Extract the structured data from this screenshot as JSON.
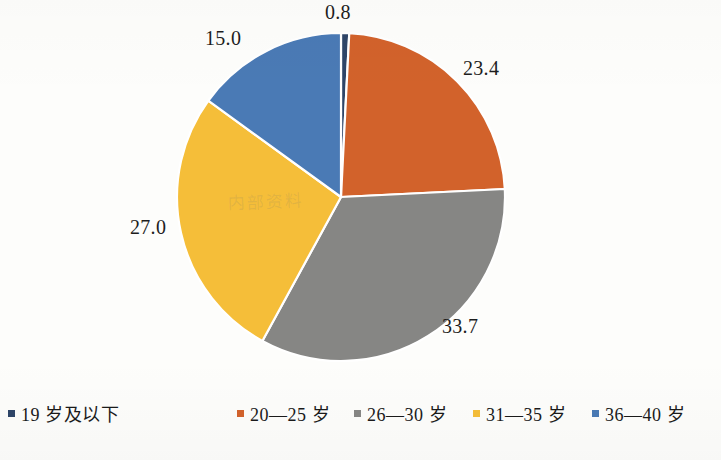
{
  "chart_data": {
    "type": "pie",
    "title": "",
    "subtitle": "",
    "xlabel": "",
    "ylabel": "",
    "legend_position": "bottom",
    "grid": false,
    "categories": [
      "19 岁及以下",
      "20—25 岁",
      "26—30 岁",
      "31—35 岁",
      "36—40 岁"
    ],
    "values": [
      0.8,
      23.4,
      33.7,
      27.0,
      15.0
    ],
    "value_labels": [
      "0.8",
      "23.4",
      "33.7",
      "27.0",
      "15.0"
    ],
    "colors": [
      "#2e4568",
      "#d2622b",
      "#868684",
      "#f5be39",
      "#4a7ab5"
    ],
    "start_angle_deg": 0,
    "direction": "clockwise",
    "slice_border_color": "#ffffff",
    "slices": [
      {
        "label": "19 岁及以下",
        "value": 0.8,
        "display": "0.8",
        "color": "#2e4568"
      },
      {
        "label": "20—25 岁",
        "value": 23.4,
        "display": "23.4",
        "color": "#d2622b"
      },
      {
        "label": "26—30 岁",
        "value": 33.7,
        "display": "33.7",
        "color": "#868684"
      },
      {
        "label": "31—35 岁",
        "value": 27.0,
        "display": "27.0",
        "color": "#f5be39"
      },
      {
        "label": "36—40 岁",
        "value": 15.0,
        "display": "15.0",
        "color": "#4a7ab5"
      }
    ]
  },
  "labels": {
    "top": "0.8",
    "upper_left": "15.0",
    "upper_right": "23.4",
    "lower_right": "33.7",
    "left": "27.0"
  },
  "legend": {
    "items": [
      {
        "label": "19 岁及以下",
        "color": "#2e4568"
      },
      {
        "label": "20—25 岁",
        "color": "#d2622b"
      },
      {
        "label": "26—30 岁",
        "color": "#868684"
      },
      {
        "label": "31—35 岁",
        "color": "#f5be39"
      },
      {
        "label": "36—40 岁",
        "color": "#4a7ab5"
      }
    ]
  },
  "watermark": {
    "text": "内部资料"
  },
  "canvas": {
    "background": "#fdfdfb"
  }
}
